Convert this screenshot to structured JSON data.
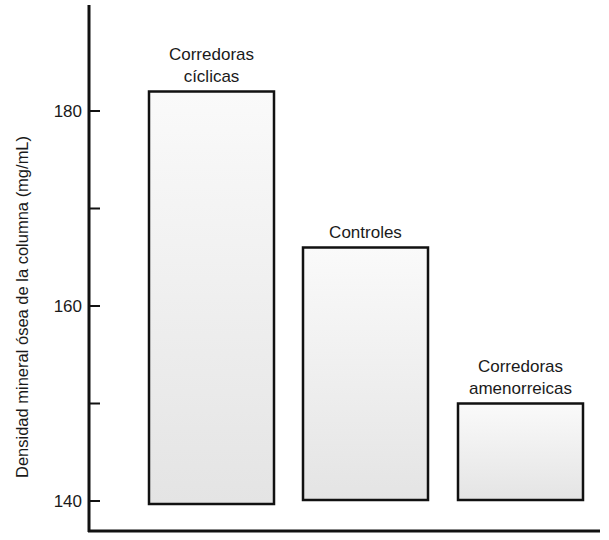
{
  "chart_data": {
    "type": "bar",
    "title": "",
    "xlabel": "",
    "ylabel": "Densidad mineral ósea de la columna (mg/mL)",
    "categories": [
      "Corredoras cíclicas",
      "Controles",
      "Corredoras amenorreicas"
    ],
    "category_label_lines": [
      [
        "Corredoras",
        "cíclicas"
      ],
      [
        "Controles"
      ],
      [
        "Corredoras",
        "amenorreicas"
      ]
    ],
    "values": [
      182,
      166,
      150
    ],
    "ylim": [
      140,
      190
    ],
    "yticks": [
      140,
      150,
      160,
      170,
      180
    ],
    "ytick_labels": [
      "140",
      "",
      "160",
      "",
      "180"
    ],
    "grid": false,
    "legend": null,
    "bar_fill": "#eeeeee",
    "bar_stroke": "#111111"
  }
}
